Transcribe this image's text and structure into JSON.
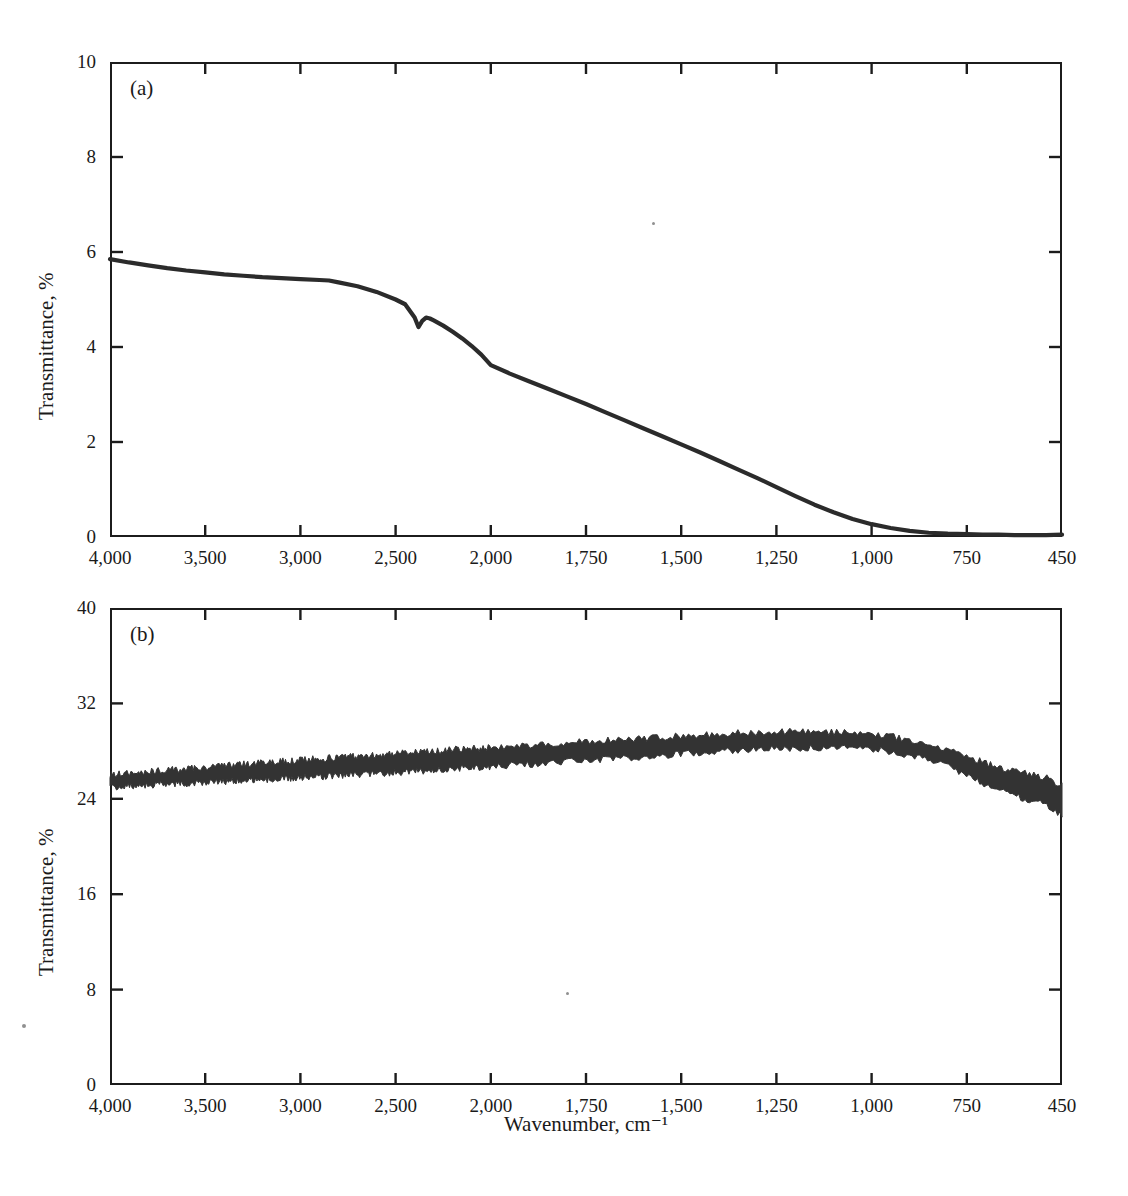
{
  "figure": {
    "background_color": "#ffffff",
    "ink_color": "#1c1c1c",
    "trace_color": "#2b2b2b"
  },
  "chart_data": [
    {
      "type": "line",
      "panel_label": "(a)",
      "title": "",
      "xlabel": "",
      "ylabel": "Transmittance, %",
      "x_tick_labels": [
        "4,000",
        "3,500",
        "3,000",
        "2,500",
        "2,000",
        "1,750",
        "1,500",
        "1,250",
        "1,000",
        "750",
        "450"
      ],
      "x_tick_values": [
        4000,
        3500,
        3000,
        2500,
        2000,
        1750,
        1500,
        1250,
        1000,
        750,
        450
      ],
      "x_axis_scale": "categorical-even-spacing",
      "x_axis_direction": "decreasing",
      "y_tick_labels": [
        "0",
        "2",
        "4",
        "6",
        "8",
        "10"
      ],
      "y_tick_values": [
        0,
        2,
        4,
        6,
        8,
        10
      ],
      "ylim": [
        0,
        10
      ],
      "grid": false,
      "legend": false,
      "series": [
        {
          "name": "Transmittance (a)",
          "x": [
            4000,
            3900,
            3800,
            3700,
            3600,
            3500,
            3400,
            3300,
            3200,
            3100,
            3000,
            2900,
            2850,
            2800,
            2700,
            2600,
            2500,
            2450,
            2400,
            2380,
            2360,
            2340,
            2320,
            2300,
            2250,
            2200,
            2150,
            2100,
            2050,
            2000,
            1950,
            1900,
            1850,
            1800,
            1750,
            1700,
            1650,
            1600,
            1550,
            1500,
            1450,
            1400,
            1350,
            1300,
            1250,
            1200,
            1150,
            1100,
            1050,
            1000,
            950,
            900,
            850,
            800,
            750,
            700,
            650,
            600,
            550,
            500,
            450
          ],
          "y": [
            5.85,
            5.78,
            5.72,
            5.66,
            5.61,
            5.57,
            5.53,
            5.5,
            5.47,
            5.45,
            5.43,
            5.41,
            5.4,
            5.36,
            5.28,
            5.16,
            5.0,
            4.9,
            4.62,
            4.42,
            4.55,
            4.62,
            4.6,
            4.56,
            4.45,
            4.32,
            4.18,
            4.02,
            3.84,
            3.62,
            3.44,
            3.28,
            3.12,
            2.96,
            2.8,
            2.63,
            2.46,
            2.29,
            2.12,
            1.95,
            1.78,
            1.6,
            1.42,
            1.24,
            1.05,
            0.86,
            0.68,
            0.52,
            0.38,
            0.27,
            0.19,
            0.13,
            0.09,
            0.07,
            0.06,
            0.05,
            0.05,
            0.04,
            0.04,
            0.04,
            0.05
          ]
        }
      ]
    },
    {
      "type": "line",
      "panel_label": "(b)",
      "title": "",
      "xlabel": "Wavenumber, cm⁻¹",
      "ylabel": "Transmittance, %",
      "x_tick_labels": [
        "4,000",
        "3,500",
        "3,000",
        "2,500",
        "2,000",
        "1,750",
        "1,500",
        "1,250",
        "1,000",
        "750",
        "450"
      ],
      "x_tick_values": [
        4000,
        3500,
        3000,
        2500,
        2000,
        1750,
        1500,
        1250,
        1000,
        750,
        450
      ],
      "x_axis_scale": "categorical-even-spacing",
      "x_axis_direction": "decreasing",
      "y_tick_labels": [
        "0",
        "8",
        "16",
        "24",
        "32",
        "40"
      ],
      "y_tick_values": [
        0,
        8,
        16,
        24,
        32,
        40
      ],
      "ylim": [
        0,
        40
      ],
      "grid": false,
      "legend": false,
      "noise_band": true,
      "series": [
        {
          "name": "Transmittance (b)",
          "x": [
            4000,
            3900,
            3800,
            3700,
            3600,
            3500,
            3400,
            3300,
            3200,
            3100,
            3000,
            2900,
            2800,
            2700,
            2600,
            2500,
            2400,
            2300,
            2200,
            2100,
            2000,
            1950,
            1900,
            1850,
            1800,
            1750,
            1700,
            1650,
            1600,
            1550,
            1500,
            1450,
            1400,
            1350,
            1300,
            1250,
            1200,
            1150,
            1100,
            1050,
            1000,
            950,
            900,
            850,
            800,
            750,
            700,
            650,
            600,
            550,
            525,
            500,
            480,
            465,
            450
          ],
          "y": [
            25.5,
            25.6,
            25.7,
            25.8,
            25.9,
            26.0,
            26.1,
            26.2,
            26.3,
            26.4,
            26.5,
            26.6,
            26.7,
            26.8,
            26.9,
            27.0,
            27.1,
            27.2,
            27.3,
            27.4,
            27.5,
            27.6,
            27.7,
            27.8,
            27.9,
            28.0,
            28.1,
            28.2,
            28.3,
            28.4,
            28.5,
            28.6,
            28.7,
            28.8,
            28.85,
            28.9,
            28.95,
            28.95,
            28.9,
            28.85,
            28.8,
            28.6,
            28.3,
            27.9,
            27.4,
            26.8,
            26.2,
            25.7,
            25.3,
            25.0,
            24.8,
            24.6,
            24.3,
            24.1,
            23.9
          ]
        }
      ]
    }
  ]
}
